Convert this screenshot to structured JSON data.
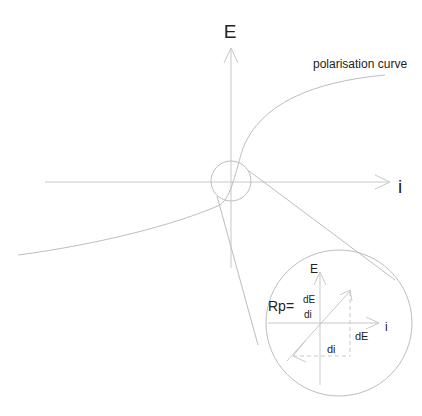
{
  "diagram": {
    "main_axes": {
      "y_label": "E",
      "x_label": "i"
    },
    "curve_label": "polarisation curve",
    "inset": {
      "y_label": "E",
      "x_label": "i",
      "formula_lhs": "Rp=",
      "formula_numerator": "dE",
      "formula_denominator": "di",
      "delta_e_label": "dE",
      "delta_i_label": "di"
    },
    "colors": {
      "line": "#c8c8c8",
      "text": "#222222",
      "background": "#ffffff"
    }
  }
}
